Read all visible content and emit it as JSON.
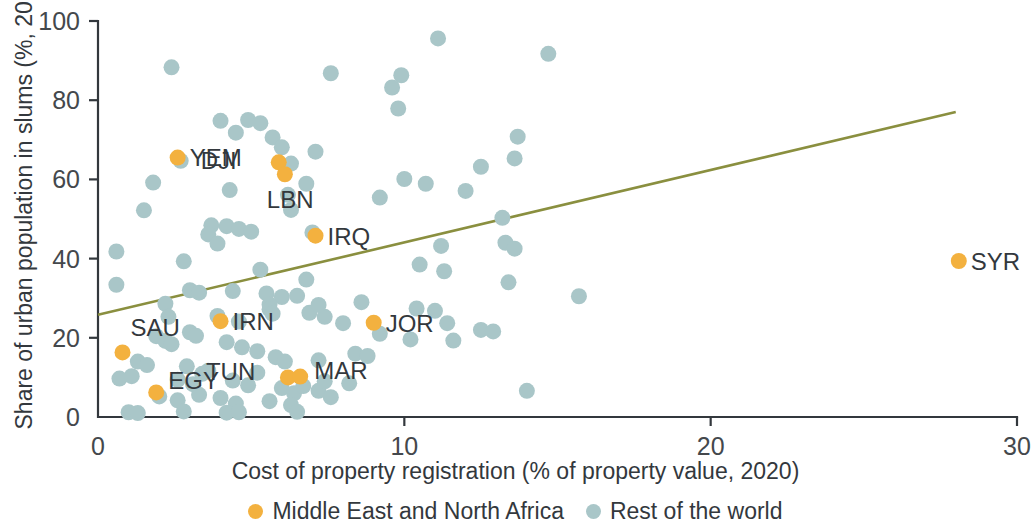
{
  "chart_data": {
    "type": "scatter",
    "title": "",
    "xlabel": "Cost of property registration (% of property value, 2020)",
    "ylabel": "Share of urban population in slums (%, 2018)",
    "xlim": [
      0,
      30
    ],
    "ylim": [
      0,
      100
    ],
    "xticks": [
      "0",
      "10",
      "20",
      "30"
    ],
    "xtick_values": [
      0,
      10,
      20,
      30
    ],
    "yticks": [
      "0",
      "20",
      "40",
      "60",
      "80",
      "100"
    ],
    "ytick_values": [
      0,
      20,
      40,
      60,
      80,
      100
    ],
    "grid": false,
    "legend_position": "bottom",
    "colors": {
      "mena": "#f3b13f",
      "rest": "#a9c6c8",
      "trend": "#8a8f3f",
      "axis": "#33383d"
    },
    "legend": [
      {
        "label": "Middle East and North Africa",
        "color": "#f3b13f",
        "key": "mena"
      },
      {
        "label": "Rest of the world",
        "color": "#a9c6c8",
        "key": "rest"
      }
    ],
    "trend_line": {
      "x": [
        0,
        28.0
      ],
      "y": [
        25.8,
        77.0
      ]
    },
    "series": [
      {
        "name": "Middle East and North Africa",
        "key": "mena",
        "color": "#f3b13f",
        "labelled": true,
        "points": [
          {
            "label": "YEM",
            "x": 2.6,
            "y": 65.5,
            "label_dx": 12,
            "label_dy": 8
          },
          {
            "label": "DJI",
            "x": 5.9,
            "y": 64.3,
            "label_dx": -78,
            "label_dy": 7
          },
          {
            "label": "LBN",
            "x": 6.1,
            "y": 61.3,
            "label_dx": -18,
            "label_dy": 34
          },
          {
            "label": "IRQ",
            "x": 7.1,
            "y": 45.8,
            "label_dx": 12,
            "label_dy": 9
          },
          {
            "label": "SYR",
            "x": 28.1,
            "y": 39.4,
            "label_dx": 12,
            "label_dy": 9
          },
          {
            "label": "JOR",
            "x": 9.0,
            "y": 23.8,
            "label_dx": 12,
            "label_dy": 9
          },
          {
            "label": "IRN",
            "x": 4.0,
            "y": 24.2,
            "label_dx": 12,
            "label_dy": 9
          },
          {
            "label": "SAU",
            "x": 0.8,
            "y": 16.3,
            "label_dx": 8,
            "label_dy": -16
          },
          {
            "label": "TUN",
            "x": 6.2,
            "y": 10.0,
            "label_dx": -82,
            "label_dy": 3
          },
          {
            "label": "MAR",
            "x": 6.6,
            "y": 10.2,
            "label_dx": 14,
            "label_dy": 2
          },
          {
            "label": "EGY",
            "x": 1.9,
            "y": 6.2,
            "label_dx": 12,
            "label_dy": -3
          }
        ]
      },
      {
        "name": "Rest of the world",
        "key": "rest",
        "color": "#a9c6c8",
        "labelled": false,
        "points": [
          {
            "x": 11.1,
            "y": 95.6
          },
          {
            "x": 14.7,
            "y": 91.7
          },
          {
            "x": 2.4,
            "y": 88.3
          },
          {
            "x": 9.9,
            "y": 86.3
          },
          {
            "x": 7.6,
            "y": 86.8
          },
          {
            "x": 9.6,
            "y": 83.2
          },
          {
            "x": 9.8,
            "y": 77.9
          },
          {
            "x": 4.0,
            "y": 74.8
          },
          {
            "x": 4.9,
            "y": 75.0
          },
          {
            "x": 5.3,
            "y": 74.2
          },
          {
            "x": 4.5,
            "y": 71.8
          },
          {
            "x": 13.7,
            "y": 70.8
          },
          {
            "x": 5.7,
            "y": 70.6
          },
          {
            "x": 6.0,
            "y": 68.1
          },
          {
            "x": 7.1,
            "y": 67.0
          },
          {
            "x": 13.6,
            "y": 65.3
          },
          {
            "x": 6.3,
            "y": 64.0
          },
          {
            "x": 2.7,
            "y": 64.7
          },
          {
            "x": 12.5,
            "y": 63.2
          },
          {
            "x": 1.8,
            "y": 59.2
          },
          {
            "x": 6.8,
            "y": 58.9
          },
          {
            "x": 10.0,
            "y": 60.1
          },
          {
            "x": 10.7,
            "y": 58.9
          },
          {
            "x": 4.3,
            "y": 57.3
          },
          {
            "x": 6.2,
            "y": 56.1
          },
          {
            "x": 12.0,
            "y": 57.1
          },
          {
            "x": 9.2,
            "y": 55.4
          },
          {
            "x": 1.5,
            "y": 52.2
          },
          {
            "x": 6.3,
            "y": 52.3
          },
          {
            "x": 13.2,
            "y": 50.3
          },
          {
            "x": 3.7,
            "y": 48.4
          },
          {
            "x": 4.2,
            "y": 48.2
          },
          {
            "x": 3.6,
            "y": 46.1
          },
          {
            "x": 4.6,
            "y": 47.5
          },
          {
            "x": 5.0,
            "y": 46.8
          },
          {
            "x": 13.3,
            "y": 44.0
          },
          {
            "x": 7.0,
            "y": 46.6
          },
          {
            "x": 11.2,
            "y": 43.2
          },
          {
            "x": 3.9,
            "y": 43.8
          },
          {
            "x": 13.6,
            "y": 42.5
          },
          {
            "x": 0.6,
            "y": 41.8
          },
          {
            "x": 2.8,
            "y": 39.3
          },
          {
            "x": 10.5,
            "y": 38.5
          },
          {
            "x": 11.3,
            "y": 36.8
          },
          {
            "x": 0.6,
            "y": 33.4
          },
          {
            "x": 5.3,
            "y": 37.2
          },
          {
            "x": 6.8,
            "y": 34.7
          },
          {
            "x": 13.4,
            "y": 34.0
          },
          {
            "x": 15.7,
            "y": 30.5
          },
          {
            "x": 3.0,
            "y": 32.0
          },
          {
            "x": 3.3,
            "y": 31.4
          },
          {
            "x": 4.4,
            "y": 31.8
          },
          {
            "x": 5.5,
            "y": 31.2
          },
          {
            "x": 6.0,
            "y": 30.3
          },
          {
            "x": 6.5,
            "y": 30.6
          },
          {
            "x": 5.6,
            "y": 28.4
          },
          {
            "x": 5.6,
            "y": 27.2
          },
          {
            "x": 5.7,
            "y": 26.1
          },
          {
            "x": 6.9,
            "y": 26.3
          },
          {
            "x": 7.4,
            "y": 25.3
          },
          {
            "x": 7.2,
            "y": 28.3
          },
          {
            "x": 8.6,
            "y": 29.0
          },
          {
            "x": 10.4,
            "y": 27.4
          },
          {
            "x": 11.0,
            "y": 26.8
          },
          {
            "x": 11.4,
            "y": 23.7
          },
          {
            "x": 12.5,
            "y": 22.0
          },
          {
            "x": 12.9,
            "y": 21.6
          },
          {
            "x": 2.2,
            "y": 28.6
          },
          {
            "x": 2.3,
            "y": 25.3
          },
          {
            "x": 3.9,
            "y": 25.5
          },
          {
            "x": 4.6,
            "y": 24.1
          },
          {
            "x": 8.0,
            "y": 23.7
          },
          {
            "x": 9.2,
            "y": 21.0
          },
          {
            "x": 10.2,
            "y": 19.6
          },
          {
            "x": 11.6,
            "y": 19.3
          },
          {
            "x": 1.9,
            "y": 20.4
          },
          {
            "x": 2.2,
            "y": 19.2
          },
          {
            "x": 2.4,
            "y": 18.4
          },
          {
            "x": 3.0,
            "y": 21.4
          },
          {
            "x": 3.2,
            "y": 20.5
          },
          {
            "x": 4.2,
            "y": 18.9
          },
          {
            "x": 4.7,
            "y": 17.6
          },
          {
            "x": 5.2,
            "y": 16.6
          },
          {
            "x": 5.8,
            "y": 15.1
          },
          {
            "x": 6.1,
            "y": 14.0
          },
          {
            "x": 7.2,
            "y": 14.3
          },
          {
            "x": 8.4,
            "y": 16.0
          },
          {
            "x": 8.8,
            "y": 15.4
          },
          {
            "x": 1.3,
            "y": 14.0
          },
          {
            "x": 1.6,
            "y": 13.1
          },
          {
            "x": 2.9,
            "y": 12.8
          },
          {
            "x": 3.6,
            "y": 11.7
          },
          {
            "x": 0.7,
            "y": 9.7
          },
          {
            "x": 1.1,
            "y": 10.3
          },
          {
            "x": 2.6,
            "y": 9.4
          },
          {
            "x": 3.1,
            "y": 8.3
          },
          {
            "x": 3.4,
            "y": 10.9
          },
          {
            "x": 4.4,
            "y": 9.2
          },
          {
            "x": 4.9,
            "y": 8.0
          },
          {
            "x": 5.2,
            "y": 11.2
          },
          {
            "x": 6.0,
            "y": 7.3
          },
          {
            "x": 6.4,
            "y": 6.0
          },
          {
            "x": 6.7,
            "y": 7.8
          },
          {
            "x": 7.2,
            "y": 6.6
          },
          {
            "x": 7.4,
            "y": 9.0
          },
          {
            "x": 8.2,
            "y": 8.5
          },
          {
            "x": 14.0,
            "y": 6.6
          },
          {
            "x": 2.0,
            "y": 5.2
          },
          {
            "x": 2.6,
            "y": 4.2
          },
          {
            "x": 3.3,
            "y": 5.6
          },
          {
            "x": 4.0,
            "y": 4.8
          },
          {
            "x": 4.5,
            "y": 3.4
          },
          {
            "x": 5.6,
            "y": 4.0
          },
          {
            "x": 6.3,
            "y": 3.0
          },
          {
            "x": 7.6,
            "y": 5.0
          },
          {
            "x": 1.0,
            "y": 1.2
          },
          {
            "x": 1.3,
            "y": 1.0
          },
          {
            "x": 2.8,
            "y": 1.4
          },
          {
            "x": 4.2,
            "y": 1.1
          },
          {
            "x": 4.6,
            "y": 1.2
          },
          {
            "x": 6.5,
            "y": 1.3
          }
        ]
      }
    ]
  }
}
